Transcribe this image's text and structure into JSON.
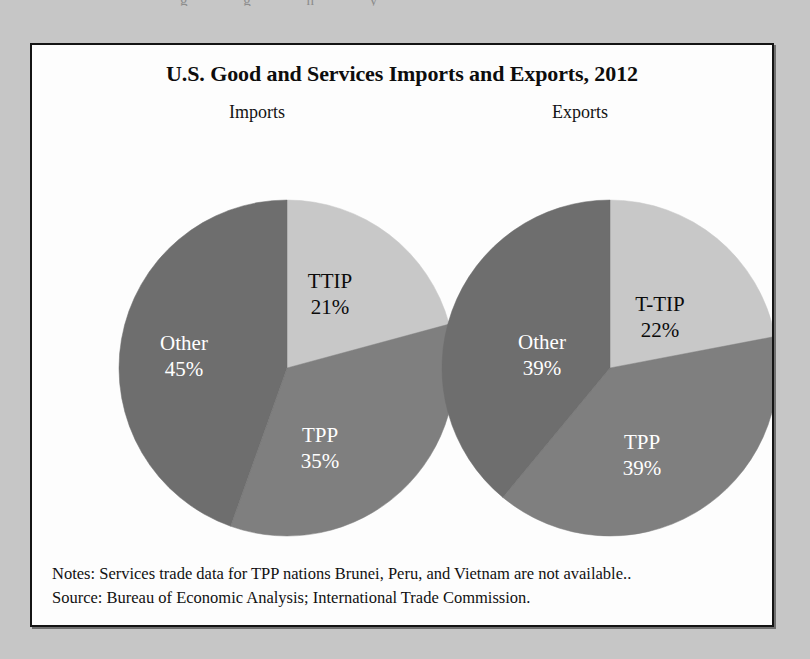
{
  "page": {
    "background_color": "#c6c6c6",
    "scan_artifact_text": "g g n y"
  },
  "figure": {
    "title": "U.S. Good and Services Imports and Exports, 2012",
    "notes_line": "Notes: Services trade data for TPP nations Brunei, Peru, and Vietnam are not available..",
    "source_line": "Source: Bureau of Economic Analysis; International Trade Commission.",
    "border_color": "#141414",
    "background_color": "#fdfdfd"
  },
  "chart_data": [
    {
      "type": "pie",
      "title": "Imports",
      "categories": [
        "TTIP",
        "TPP",
        "Other"
      ],
      "values": [
        21,
        35,
        45
      ],
      "labels": [
        "TTIP\n21%",
        "TPP\n35%",
        "Other\n45%"
      ],
      "value_labels": [
        "21%",
        "22%",
        "45%"
      ],
      "colors": [
        "#c8c8c8",
        "#7f7f7f",
        "#6e6e6e"
      ],
      "label_text_colors": [
        "#0b0b0b",
        "#ffffff",
        "#ffffff"
      ],
      "start_angle_deg": 0,
      "direction": "clockwise",
      "center": [
        255,
        323
      ],
      "radius": 168,
      "slices": [
        {
          "name": "TTIP",
          "percent": 21,
          "percent_label": "21%",
          "color": "#c8c8c8",
          "text_color": "#0b0b0b"
        },
        {
          "name": "TPP",
          "percent": 35,
          "percent_label": "35%",
          "color": "#7f7f7f",
          "text_color": "#ffffff"
        },
        {
          "name": "Other",
          "percent": 45,
          "percent_label": "45%",
          "color": "#6e6e6e",
          "text_color": "#ffffff"
        }
      ]
    },
    {
      "type": "pie",
      "title": "Exports",
      "categories": [
        "T-TIP",
        "TPP",
        "Other"
      ],
      "values": [
        22,
        39,
        39
      ],
      "labels": [
        "T-TIP\n22%",
        "TPP\n39%",
        "Other\n39%"
      ],
      "value_labels": [
        "22%",
        "39%",
        "39%"
      ],
      "colors": [
        "#c8c8c8",
        "#7f7f7f",
        "#6e6e6e"
      ],
      "label_text_colors": [
        "#0b0b0b",
        "#ffffff",
        "#ffffff"
      ],
      "start_angle_deg": 0,
      "direction": "clockwise",
      "center": [
        578,
        323
      ],
      "radius": 168,
      "slices": [
        {
          "name": "T-TIP",
          "percent": 22,
          "percent_label": "22%",
          "color": "#c8c8c8",
          "text_color": "#0b0b0b"
        },
        {
          "name": "TPP",
          "percent": 39,
          "percent_label": "39%",
          "color": "#7f7f7f",
          "text_color": "#ffffff"
        },
        {
          "name": "Other",
          "percent": 39,
          "percent_label": "39%",
          "color": "#6e6e6e",
          "text_color": "#ffffff"
        }
      ]
    }
  ],
  "label_offsets": {
    "imports": [
      {
        "name": "TTIP",
        "x": 298,
        "y": 243,
        "anchor": "middle"
      },
      {
        "name": "TPP",
        "x": 288,
        "y": 397,
        "anchor": "middle"
      },
      {
        "name": "Other",
        "x": 152,
        "y": 305,
        "anchor": "middle"
      }
    ],
    "exports": [
      {
        "name": "T-TIP",
        "x": 628,
        "y": 266,
        "anchor": "middle"
      },
      {
        "name": "TPP",
        "x": 610,
        "y": 404,
        "anchor": "middle"
      },
      {
        "name": "Other",
        "x": 510,
        "y": 304,
        "anchor": "middle"
      }
    ]
  }
}
